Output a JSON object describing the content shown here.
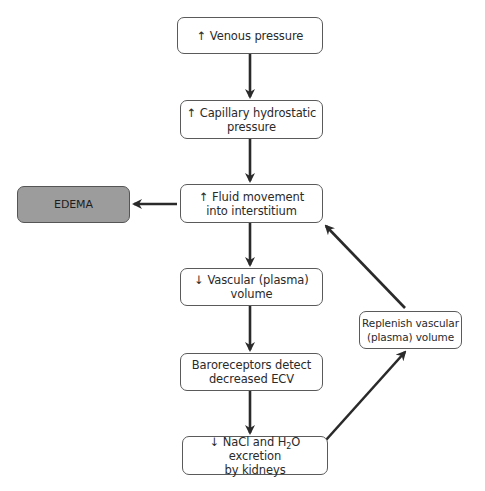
{
  "diagram": {
    "nodes": [
      {
        "id": "venous-pressure",
        "label": "↑ Venous pressure"
      },
      {
        "id": "capillary-pressure",
        "label": "↑ Capillary hydrostatic\npressure"
      },
      {
        "id": "fluid-movement",
        "label": "↑ Fluid movement\ninto interstitium"
      },
      {
        "id": "vascular-volume",
        "label": "↓ Vascular (plasma)\nvolume"
      },
      {
        "id": "baroreceptors",
        "label": "Baroreceptors detect\ndecreased ECV"
      },
      {
        "id": "nacl-excretion",
        "label_part1": "↓ NaCl and H",
        "label_sub": "2",
        "label_part2": "O excretion",
        "label_line2": "by kidneys"
      },
      {
        "id": "edema",
        "label": "EDEMA"
      },
      {
        "id": "replenish",
        "label": "Replenish vascular\n(plasma) volume"
      }
    ],
    "edges": [
      {
        "from": "venous-pressure",
        "to": "capillary-pressure"
      },
      {
        "from": "capillary-pressure",
        "to": "fluid-movement"
      },
      {
        "from": "fluid-movement",
        "to": "vascular-volume"
      },
      {
        "from": "vascular-volume",
        "to": "baroreceptors"
      },
      {
        "from": "baroreceptors",
        "to": "nacl-excretion"
      },
      {
        "from": "fluid-movement",
        "to": "edema"
      },
      {
        "from": "nacl-excretion",
        "to": "replenish"
      },
      {
        "from": "replenish",
        "to": "fluid-movement"
      }
    ],
    "colors": {
      "edema_fill": "#9c9c9c",
      "stroke": "#2a2a2a",
      "box_border": "#5a5a5a"
    }
  }
}
